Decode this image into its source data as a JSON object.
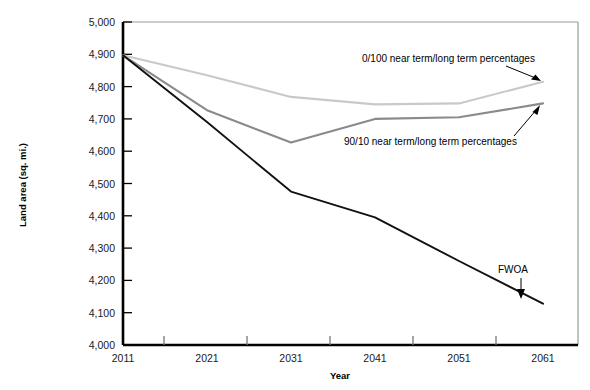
{
  "chart_data": {
    "type": "line",
    "title": "",
    "xlabel": "Year",
    "ylabel": "Land area (sq. mi.)",
    "x": [
      2011,
      2021,
      2031,
      2041,
      2051,
      2061
    ],
    "xticklabels": [
      "2011",
      "2021",
      "2031",
      "2041",
      "2051",
      "2061"
    ],
    "yticklabels": [
      "4,000",
      "4,100",
      "4,200",
      "4,300",
      "4,400",
      "4,500",
      "4,600",
      "4,700",
      "4,800",
      "4,900",
      "5,000"
    ],
    "ylim": [
      4000,
      5000
    ],
    "ytick_step": 100,
    "grid": false,
    "legend": "none (inline annotations with leader arrows)",
    "series": [
      {
        "name": "0/100 near term/long term percentages",
        "color": "#c9c9c9",
        "values": [
          4897,
          4835,
          4768,
          4745,
          4748,
          4815
        ]
      },
      {
        "name": "90/10 near term/long term percentages",
        "color": "#8a8a8a",
        "values": [
          4897,
          4727,
          4627,
          4700,
          4705,
          4748
        ]
      },
      {
        "name": "FWOA",
        "color": "#111111",
        "values": [
          4897,
          4690,
          4475,
          4395,
          4260,
          4128
        ]
      }
    ],
    "annotations": [
      {
        "text": "0/100 near term/long term percentages",
        "target_series": "0/100 near term/long term percentages"
      },
      {
        "text": "90/10 near term/long term percentages",
        "target_series": "90/10 near term/long term percentages"
      },
      {
        "text": "FWOA",
        "target_series": "FWOA"
      }
    ]
  },
  "axes": {
    "y_label": "Land area (sq. mi.)",
    "x_label": "Year",
    "y_ticks": [
      "5,000",
      "4,900",
      "4,800",
      "4,700",
      "4,600",
      "4,500",
      "4,400",
      "4,300",
      "4,200",
      "4,100",
      "4,000"
    ],
    "x_ticks": [
      "2011",
      "2021",
      "2031",
      "2041",
      "2051",
      "2061"
    ]
  },
  "annotations": {
    "upper": "0/100 near term/long term percentages",
    "lower": "90/10 near term/long term percentages",
    "fwoa": "FWOA"
  },
  "colors": {
    "series_light": "#c9c9c9",
    "series_mid": "#8a8a8a",
    "series_dark": "#111111",
    "axis": "#000000",
    "frame": "#9a9a9a"
  }
}
